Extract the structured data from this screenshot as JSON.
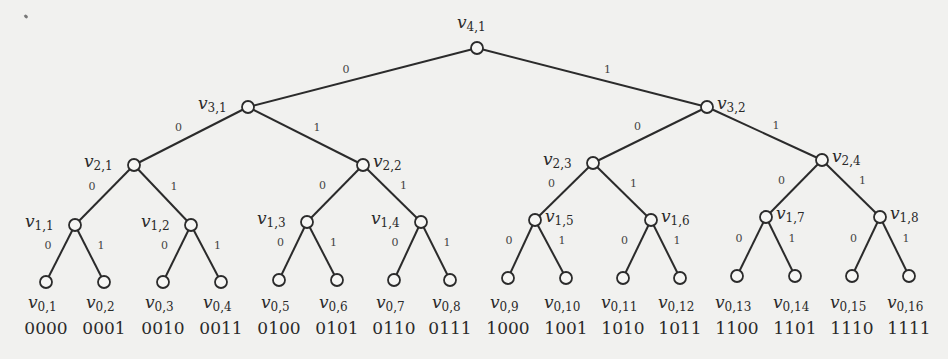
{
  "diagram": {
    "type": "binary-tree",
    "nodes": {
      "v4_1": {
        "label": "v",
        "sub": "4,1",
        "x": 477,
        "y": 48
      },
      "v3_1": {
        "label": "v",
        "sub": "3,1",
        "x": 248,
        "y": 107
      },
      "v3_2": {
        "label": "v",
        "sub": "3,2",
        "x": 707,
        "y": 107
      },
      "v2_1": {
        "label": "v",
        "sub": "2,1",
        "x": 134,
        "y": 165
      },
      "v2_2": {
        "label": "v",
        "sub": "2,2",
        "x": 363,
        "y": 165
      },
      "v2_3": {
        "label": "v",
        "sub": "2,3",
        "x": 593,
        "y": 163
      },
      "v2_4": {
        "label": "v",
        "sub": "2,4",
        "x": 822,
        "y": 160
      },
      "v1_1": {
        "label": "v",
        "sub": "1,1",
        "x": 75,
        "y": 225
      },
      "v1_2": {
        "label": "v",
        "sub": "1,2",
        "x": 191,
        "y": 225
      },
      "v1_3": {
        "label": "v",
        "sub": "1,3",
        "x": 307,
        "y": 222
      },
      "v1_4": {
        "label": "v",
        "sub": "1,4",
        "x": 421,
        "y": 222
      },
      "v1_5": {
        "label": "v",
        "sub": "1,5",
        "x": 535,
        "y": 220
      },
      "v1_6": {
        "label": "v",
        "sub": "1,6",
        "x": 651,
        "y": 220
      },
      "v1_7": {
        "label": "v",
        "sub": "1,7",
        "x": 766,
        "y": 217
      },
      "v1_8": {
        "label": "v",
        "sub": "1,8",
        "x": 880,
        "y": 217
      }
    },
    "leaves": [
      {
        "label": "v",
        "sub": "0,1",
        "code": "0000",
        "x": 46,
        "y": 282
      },
      {
        "label": "v",
        "sub": "0,2",
        "code": "0001",
        "x": 104,
        "y": 282
      },
      {
        "label": "v",
        "sub": "0,3",
        "code": "0010",
        "x": 163,
        "y": 282
      },
      {
        "label": "v",
        "sub": "0,4",
        "code": "0011",
        "x": 221,
        "y": 282
      },
      {
        "label": "v",
        "sub": "0,5",
        "code": "0100",
        "x": 279,
        "y": 280
      },
      {
        "label": "v",
        "sub": "0,6",
        "code": "0101",
        "x": 337,
        "y": 280
      },
      {
        "label": "v",
        "sub": "0,7",
        "code": "0110",
        "x": 394,
        "y": 280
      },
      {
        "label": "v",
        "sub": "0,8",
        "code": "0111",
        "x": 450,
        "y": 280
      },
      {
        "label": "v",
        "sub": "0,9",
        "code": "1000",
        "x": 508,
        "y": 278
      },
      {
        "label": "v",
        "sub": "0,10",
        "code": "1001",
        "x": 566,
        "y": 278
      },
      {
        "label": "v",
        "sub": "0,11",
        "code": "1010",
        "x": 623,
        "y": 278
      },
      {
        "label": "v",
        "sub": "0,12",
        "code": "1011",
        "x": 680,
        "y": 278
      },
      {
        "label": "v",
        "sub": "0,13",
        "code": "1100",
        "x": 737,
        "y": 276
      },
      {
        "label": "v",
        "sub": "0,14",
        "code": "1101",
        "x": 795,
        "y": 276
      },
      {
        "label": "v",
        "sub": "0,15",
        "code": "1110",
        "x": 852,
        "y": 276
      },
      {
        "label": "v",
        "sub": "0,16",
        "code": "1111",
        "x": 909,
        "y": 276
      }
    ],
    "edge_labels": {
      "left": "0",
      "right": "1"
    }
  }
}
